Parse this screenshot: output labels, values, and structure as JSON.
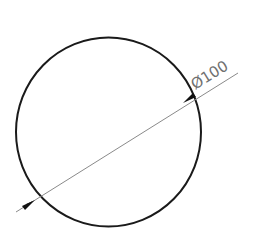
{
  "drawing": {
    "type": "circle-diameter-dimension",
    "dimension_label": "Ø100",
    "colors": {
      "circle": "#1a1a1a",
      "dimension_line": "#8a8a8a",
      "arrow": "#111111",
      "text": "#707070",
      "background": "#ffffff"
    }
  }
}
